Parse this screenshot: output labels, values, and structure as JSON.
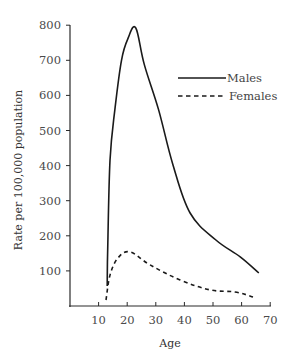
{
  "chart_data": {
    "type": "line",
    "title": "",
    "xlabel": "Age",
    "ylabel": "Rate per 100,000 population",
    "xlim": [
      0,
      70
    ],
    "ylim": [
      0,
      800
    ],
    "x_ticks": [
      10,
      20,
      30,
      40,
      50,
      60,
      70
    ],
    "y_ticks": [
      100,
      200,
      300,
      400,
      500,
      600,
      700,
      800
    ],
    "grid": false,
    "legend_position": "upper right",
    "series": [
      {
        "name": "Males",
        "style": "solid",
        "color": "#1a1a1a",
        "x": [
          13,
          13.2,
          14,
          15.7,
          18,
          20.3,
          23,
          26,
          31,
          36,
          42,
          51,
          59.5,
          66
        ],
        "y": [
          57,
          175,
          415,
          560,
          700,
          763,
          792,
          687,
          558,
          402,
          265,
          188,
          140,
          94
        ]
      },
      {
        "name": "Females",
        "style": "dashed",
        "color": "#1a1a1a",
        "x": [
          12.6,
          14,
          16.8,
          21,
          28,
          38.5,
          49,
          57.7,
          64
        ],
        "y": [
          17,
          88,
          137,
          154,
          117,
          74,
          46,
          40,
          26
        ]
      }
    ]
  }
}
